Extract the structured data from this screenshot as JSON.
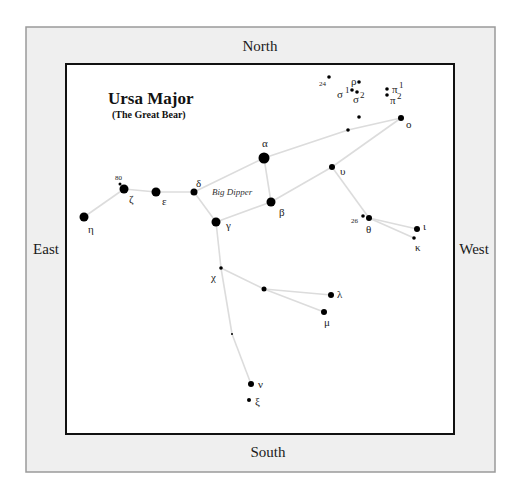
{
  "chart": {
    "title": "Ursa Major",
    "subtitle": "(The Great Bear)",
    "asterism_label": "Big Dipper",
    "directions": {
      "north": "North",
      "south": "South",
      "east": "East",
      "west": "West"
    },
    "colors": {
      "frame_fill": "#efefef",
      "frame_stroke": "#9a9a9a",
      "map_fill": "#ffffff",
      "map_stroke": "#111111",
      "line": "#dcdcdc",
      "star": "#000000"
    }
  },
  "stars": [
    {
      "id": "alpha",
      "x": 264,
      "y": 158,
      "r": 5.5
    },
    {
      "id": "beta",
      "x": 271,
      "y": 202,
      "r": 4.5
    },
    {
      "id": "gamma",
      "x": 216,
      "y": 222,
      "r": 4.5
    },
    {
      "id": "delta",
      "x": 194,
      "y": 192,
      "r": 3.5
    },
    {
      "id": "epsilon",
      "x": 156,
      "y": 192,
      "r": 4.5
    },
    {
      "id": "zeta",
      "x": 124,
      "y": 189,
      "r": 4.5
    },
    {
      "id": "eta",
      "x": 84,
      "y": 217,
      "r": 4.5
    },
    {
      "id": "80",
      "x": 120,
      "y": 184,
      "r": 1.5
    },
    {
      "id": "upsilon",
      "x": 332,
      "y": 167,
      "r": 3
    },
    {
      "id": "omicron",
      "x": 401,
      "y": 118,
      "r": 3
    },
    {
      "id": "unl1",
      "x": 348,
      "y": 130,
      "r": 1.8
    },
    {
      "id": "unl2",
      "x": 359,
      "y": 117,
      "r": 1.8
    },
    {
      "id": "theta",
      "x": 369,
      "y": 218,
      "r": 3
    },
    {
      "id": "26",
      "x": 363,
      "y": 216,
      "r": 1.8
    },
    {
      "id": "iota",
      "x": 417,
      "y": 229,
      "r": 3
    },
    {
      "id": "kappa",
      "x": 414,
      "y": 238,
      "r": 1.8
    },
    {
      "id": "chi",
      "x": 221,
      "y": 268,
      "r": 1.8
    },
    {
      "id": "psi",
      "x": 264,
      "y": 289,
      "r": 2.5
    },
    {
      "id": "lambda",
      "x": 331,
      "y": 295,
      "r": 3
    },
    {
      "id": "mu",
      "x": 324,
      "y": 312,
      "r": 3
    },
    {
      "id": "omega",
      "x": 232,
      "y": 334,
      "r": 1
    },
    {
      "id": "nu",
      "x": 251,
      "y": 384,
      "r": 3
    },
    {
      "id": "xi",
      "x": 249,
      "y": 400,
      "r": 2
    },
    {
      "id": "24",
      "x": 329,
      "y": 77,
      "r": 1.8
    },
    {
      "id": "rho",
      "x": 359,
      "y": 82,
      "r": 1.8
    },
    {
      "id": "sigma1",
      "x": 352,
      "y": 90,
      "r": 1.8
    },
    {
      "id": "sigma2",
      "x": 357,
      "y": 92,
      "r": 1.8
    },
    {
      "id": "pi1",
      "x": 387,
      "y": 89,
      "r": 1.8
    },
    {
      "id": "pi2",
      "x": 387,
      "y": 95,
      "r": 1.8
    }
  ],
  "lines": [
    [
      "eta",
      "zeta"
    ],
    [
      "zeta",
      "epsilon"
    ],
    [
      "epsilon",
      "delta"
    ],
    [
      "delta",
      "alpha"
    ],
    [
      "delta",
      "gamma"
    ],
    [
      "gamma",
      "beta"
    ],
    [
      "beta",
      "alpha"
    ],
    [
      "alpha",
      "unl1"
    ],
    [
      "unl1",
      "omicron"
    ],
    [
      "omicron",
      "upsilon"
    ],
    [
      "upsilon",
      "beta"
    ],
    [
      "upsilon",
      "theta"
    ],
    [
      "theta",
      "iota"
    ],
    [
      "theta",
      "kappa"
    ],
    [
      "gamma",
      "chi"
    ],
    [
      "chi",
      "psi"
    ],
    [
      "psi",
      "lambda"
    ],
    [
      "psi",
      "mu"
    ],
    [
      "chi",
      "omega"
    ],
    [
      "omega",
      "nu"
    ]
  ],
  "labels": [
    {
      "text": "α",
      "x": 262,
      "y": 147,
      "cls": "lbl"
    },
    {
      "text": "β",
      "x": 279,
      "y": 216,
      "cls": "lbl"
    },
    {
      "text": "γ",
      "x": 226,
      "y": 229,
      "cls": "lbl"
    },
    {
      "text": "δ",
      "x": 196,
      "y": 187,
      "cls": "lbl"
    },
    {
      "text": "ε",
      "x": 162,
      "y": 205,
      "cls": "lbl"
    },
    {
      "text": "ζ",
      "x": 129,
      "y": 203,
      "cls": "lbl"
    },
    {
      "text": "η",
      "x": 88,
      "y": 233,
      "cls": "lbl"
    },
    {
      "text": "80",
      "x": 115,
      "y": 180,
      "cls": "num"
    },
    {
      "text": "υ",
      "x": 340,
      "y": 175,
      "cls": "lbl"
    },
    {
      "text": "ο",
      "x": 406,
      "y": 128,
      "cls": "lbl"
    },
    {
      "text": "θ",
      "x": 366,
      "y": 233,
      "cls": "lbl"
    },
    {
      "text": "26",
      "x": 351,
      "y": 223,
      "cls": "num"
    },
    {
      "text": "ι",
      "x": 423,
      "y": 230,
      "cls": "lbl"
    },
    {
      "text": "κ",
      "x": 415,
      "y": 251,
      "cls": "lbl"
    },
    {
      "text": "χ",
      "x": 211,
      "y": 281,
      "cls": "lbl"
    },
    {
      "text": "λ",
      "x": 337,
      "y": 298,
      "cls": "lbl"
    },
    {
      "text": "μ",
      "x": 324,
      "y": 326,
      "cls": "lbl"
    },
    {
      "text": "ν",
      "x": 258,
      "y": 388,
      "cls": "lbl"
    },
    {
      "text": "ξ",
      "x": 255,
      "y": 405,
      "cls": "lbl"
    },
    {
      "text": "24",
      "x": 319,
      "y": 86,
      "cls": "num"
    },
    {
      "text": "ρ",
      "x": 351,
      "y": 85,
      "cls": "lbl"
    },
    {
      "text": "σ",
      "x": 337,
      "y": 98,
      "cls": "lbl"
    },
    {
      "text": "1",
      "x": 345,
      "y": 93,
      "cls": "sup"
    },
    {
      "text": "σ",
      "x": 353,
      "y": 103,
      "cls": "lbl"
    },
    {
      "text": "2",
      "x": 360,
      "y": 98,
      "cls": "sup"
    },
    {
      "text": "π",
      "x": 392,
      "y": 93,
      "cls": "lbl"
    },
    {
      "text": "1",
      "x": 399,
      "y": 88,
      "cls": "sup"
    },
    {
      "text": "π",
      "x": 390,
      "y": 104,
      "cls": "lbl"
    },
    {
      "text": "2",
      "x": 397,
      "y": 99,
      "cls": "sup"
    }
  ]
}
